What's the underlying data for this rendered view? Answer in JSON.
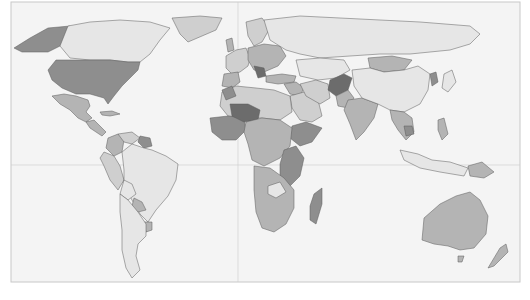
{
  "map": {
    "type": "choropleth",
    "projection": "equirectangular-like",
    "palette": {
      "ocean": "#f4f4f4",
      "frame": "#c8c8c8",
      "grid": "#d0d0d0",
      "border": "#5a5a5a",
      "level_1": "#e6e6e6",
      "level_2": "#cfcfcf",
      "level_3": "#b4b4b4",
      "level_4": "#8e8e8e",
      "level_5": "#6c6c6c"
    },
    "frame": {
      "x": 11,
      "y": 2,
      "width": 509,
      "height": 280
    },
    "gridlines": {
      "vertical_x": 238,
      "horizontal_y": 165
    },
    "regions": [
      {
        "id": "alaska",
        "name": "Alaska",
        "level": 4,
        "points": "14,48 30,38 48,28 70,26 68,38 60,46 48,52 34,52 22,52"
      },
      {
        "id": "canada",
        "name": "Canada",
        "level": 1,
        "points": "68,26 90,22 120,20 150,22 170,28 160,40 150,54 140,62 128,62 110,60 90,60 70,58 60,46"
      },
      {
        "id": "greenland",
        "name": "Greenland",
        "level": 2,
        "points": "172,18 200,16 222,18 216,30 202,36 188,42 180,34"
      },
      {
        "id": "usa",
        "name": "United States",
        "level": 4,
        "points": "56,60 90,60 110,60 128,62 140,62 138,70 130,78 122,86 114,96 108,104 104,98 90,94 76,94 62,88 52,80 48,70"
      },
      {
        "id": "mexico",
        "name": "Mexico",
        "level": 3,
        "points": "52,96 64,94 76,96 88,100 90,106 86,112 92,118 86,122 78,118 70,110 60,104"
      },
      {
        "id": "central-america",
        "name": "Central America",
        "level": 3,
        "points": "86,122 94,120 100,126 106,132 102,136 96,132 90,128"
      },
      {
        "id": "cuba",
        "name": "Cuba",
        "level": 3,
        "points": "100,112 112,111 120,114 110,116 102,115"
      },
      {
        "id": "colombia",
        "name": "Colombia",
        "level": 3,
        "points": "108,138 118,134 124,140 122,152 114,156 106,148"
      },
      {
        "id": "venezuela",
        "name": "Venezuela",
        "level": 2,
        "points": "118,134 132,132 140,138 132,144 124,142"
      },
      {
        "id": "guianas",
        "name": "Guyana/Suriname",
        "level": 4,
        "points": "140,136 150,138 152,146 144,148 138,142"
      },
      {
        "id": "peru",
        "name": "Peru",
        "level": 2,
        "points": "104,152 114,156 120,166 124,180 118,190 110,180 104,166 100,158"
      },
      {
        "id": "brazil",
        "name": "Brazil",
        "level": 1,
        "points": "122,152 132,144 144,148 152,150 166,156 178,164 176,180 168,196 156,210 148,222 140,214 132,200 124,186 124,170"
      },
      {
        "id": "bolivia",
        "name": "Bolivia",
        "level": 1,
        "points": "124,180 132,184 136,194 128,200 120,194"
      },
      {
        "id": "paraguay",
        "name": "Paraguay",
        "level": 3,
        "points": "134,198 142,202 146,210 138,212 132,206"
      },
      {
        "id": "uruguay",
        "name": "Uruguay",
        "level": 3,
        "points": "144,222 152,222 152,230 146,232"
      },
      {
        "id": "chile-argentina",
        "name": "Argentina/Chile",
        "level": 1,
        "points": "120,194 128,200 138,212 146,224 146,236 138,244 136,256 140,270 132,278 126,268 122,250 122,230 120,212"
      },
      {
        "id": "western-europe",
        "name": "Western Europe",
        "level": 2,
        "points": "226,56 236,50 246,48 250,58 248,66 240,72 232,74 226,68"
      },
      {
        "id": "iberia",
        "name": "Iberia",
        "level": 3,
        "points": "224,74 238,72 240,82 232,88 222,86"
      },
      {
        "id": "uk",
        "name": "United Kingdom",
        "level": 3,
        "points": "226,40 232,38 234,50 228,52"
      },
      {
        "id": "scandinavia",
        "name": "Scandinavia",
        "level": 2,
        "points": "246,22 262,18 270,28 262,42 254,46 248,36"
      },
      {
        "id": "central-europe",
        "name": "Central/Eastern Europe",
        "level": 3,
        "points": "248,48 264,44 280,46 286,56 278,66 264,72 254,70 248,60"
      },
      {
        "id": "balkans",
        "name": "Balkans",
        "level": 5,
        "points": "254,66 264,68 266,76 258,78"
      },
      {
        "id": "russia",
        "name": "Russia",
        "level": 1,
        "points": "264,20 300,16 340,18 380,20 420,22 470,26 480,34 470,44 450,50 430,52 410,54 380,54 350,56 320,58 300,54 286,50 270,40"
      },
      {
        "id": "turkey",
        "name": "Turkey",
        "level": 3,
        "points": "266,76 282,74 296,76 294,82 278,84 266,82"
      },
      {
        "id": "middle-east",
        "name": "Middle East",
        "level": 3,
        "points": "284,84 296,82 304,88 300,96 290,94"
      },
      {
        "id": "saudi-arabia",
        "name": "Arabian Peninsula",
        "level": 2,
        "points": "290,96 304,92 318,100 322,116 312,122 300,120 292,108"
      },
      {
        "id": "iran",
        "name": "Iran",
        "level": 2,
        "points": "300,84 316,80 328,84 330,98 320,104 306,96"
      },
      {
        "id": "central-asia",
        "name": "Central Asia",
        "level": 1,
        "points": "296,60 320,58 344,60 350,70 336,78 318,80 300,76"
      },
      {
        "id": "afghanistan",
        "name": "Afghanistan",
        "level": 5,
        "points": "330,80 344,74 352,78 348,90 336,96 328,90"
      },
      {
        "id": "pakistan",
        "name": "Pakistan",
        "level": 3,
        "points": "336,96 348,90 354,98 348,108 338,106"
      },
      {
        "id": "india",
        "name": "India",
        "level": 3,
        "points": "348,100 362,98 378,104 374,118 364,132 356,140 350,124 344,110"
      },
      {
        "id": "mongolia",
        "name": "Mongolia",
        "level": 3,
        "points": "368,58 392,56 412,60 404,70 384,72 370,68"
      },
      {
        "id": "china",
        "name": "China",
        "level": 1,
        "points": "352,70 370,68 384,72 404,70 418,66 430,74 428,90 420,104 404,112 390,110 378,104 362,98 354,86"
      },
      {
        "id": "korea",
        "name": "North Korea",
        "level": 4,
        "points": "430,74 436,72 438,82 432,86"
      },
      {
        "id": "japan",
        "name": "Japan",
        "level": 1,
        "points": "444,74 452,70 456,82 448,92 442,88"
      },
      {
        "id": "southeast-asia",
        "name": "Southeast Asia",
        "level": 3,
        "points": "390,110 404,112 412,118 414,132 406,140 398,130 392,120"
      },
      {
        "id": "cambodia",
        "name": "Cambodia",
        "level": 4,
        "points": "404,126 412,126 414,134 406,136"
      },
      {
        "id": "philippines",
        "name": "Philippines",
        "level": 3,
        "points": "438,120 444,118 448,134 442,140 438,130"
      },
      {
        "id": "indonesia",
        "name": "Indonesia",
        "level": 1,
        "points": "400,150 418,154 432,160 450,162 468,168 464,176 440,172 420,168 404,160"
      },
      {
        "id": "papua",
        "name": "Papua New Guinea",
        "level": 3,
        "points": "468,166 482,162 494,172 484,178 470,176"
      },
      {
        "id": "australia",
        "name": "Australia",
        "level": 3,
        "points": "424,218 440,204 456,196 470,192 480,200 488,216 486,234 474,248 460,250 448,246 434,244 422,240"
      },
      {
        "id": "tasmania",
        "name": "Tasmania",
        "level": 3,
        "points": "458,256 464,256 462,262 458,262"
      },
      {
        "id": "new-zealand",
        "name": "New Zealand",
        "level": 3,
        "points": "500,248 506,244 508,252 494,266 488,268 494,258"
      },
      {
        "id": "north-africa",
        "name": "North Africa",
        "level": 2,
        "points": "222,92 236,86 256,88 274,90 290,96 292,112 280,120 262,118 244,118 228,116 220,106"
      },
      {
        "id": "morocco",
        "name": "Morocco",
        "level": 4,
        "points": "222,90 232,86 236,96 226,100"
      },
      {
        "id": "west-africa",
        "name": "West Africa",
        "level": 4,
        "points": "210,118 228,116 244,118 246,130 236,140 222,140 212,132"
      },
      {
        "id": "mali-niger",
        "name": "Sahel",
        "level": 5,
        "points": "230,104 248,104 260,110 258,120 244,122 232,116"
      },
      {
        "id": "ethiopia-horn",
        "name": "Horn of Africa",
        "level": 4,
        "points": "292,126 306,122 322,128 312,142 300,146 290,138"
      },
      {
        "id": "central-africa",
        "name": "Central Africa",
        "level": 3,
        "points": "246,122 262,118 280,120 292,128 290,146 280,158 264,166 252,160 248,144 244,132"
      },
      {
        "id": "east-africa",
        "name": "East Africa",
        "level": 4,
        "points": "284,150 296,146 304,158 300,176 290,186 280,178 280,164"
      },
      {
        "id": "southern-africa",
        "name": "Southern Africa",
        "level": 3,
        "points": "254,166 270,168 284,178 294,190 294,208 286,224 274,232 262,228 256,212 254,190"
      },
      {
        "id": "zambia",
        "name": "Zambia",
        "level": 1,
        "points": "268,186 280,182 286,192 276,198 268,194"
      },
      {
        "id": "madagascar",
        "name": "Madagascar",
        "level": 4,
        "points": "314,194 322,188 322,204 316,224 310,220 310,206"
      }
    ]
  }
}
